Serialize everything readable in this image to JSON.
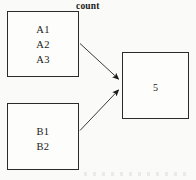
{
  "diagram": {
    "title_label": "count",
    "nodes": [
      {
        "id": "group-a",
        "items": [
          "A1",
          "A2",
          "A3"
        ]
      },
      {
        "id": "group-b",
        "items": [
          "B1",
          "B2"
        ]
      },
      {
        "id": "result",
        "value": "5"
      }
    ],
    "edges": [
      {
        "from": "group-a",
        "to": "result",
        "arrowhead": "filled-triangle"
      },
      {
        "from": "group-b",
        "to": "result",
        "arrowhead": "filled-triangle"
      }
    ],
    "colors": {
      "stroke": "#2b2b2b",
      "text": "#1a1a1a",
      "background": "#fafaf8",
      "box_fill": "#fdfdfb"
    }
  }
}
